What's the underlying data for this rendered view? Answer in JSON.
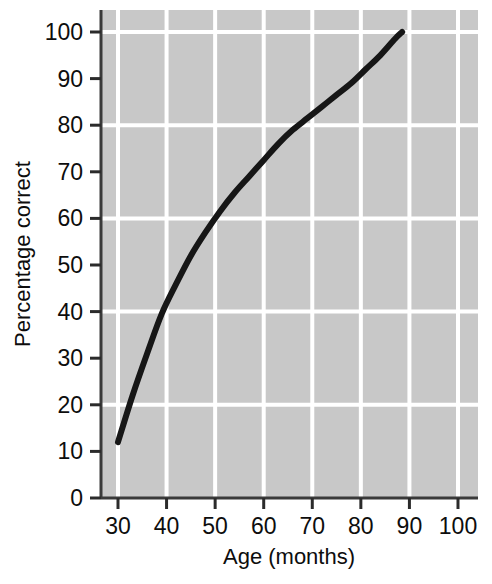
{
  "chart_data": {
    "type": "line",
    "title": "",
    "xlabel": "Age (months)",
    "ylabel": "Percentage correct",
    "xlim": [
      25,
      103
    ],
    "ylim": [
      0,
      105
    ],
    "xticks": [
      30,
      40,
      50,
      60,
      70,
      80,
      90,
      100
    ],
    "yticks": [
      0,
      10,
      20,
      30,
      40,
      50,
      60,
      70,
      80,
      90,
      100
    ],
    "xtick_labels": [
      "30",
      "40",
      "50",
      "60",
      "70",
      "80",
      "90",
      "100"
    ],
    "ytick_labels": [
      "0",
      "10",
      "20",
      "30",
      "40",
      "50",
      "60",
      "70",
      "80",
      "90",
      "100"
    ],
    "grid": true,
    "grid_x_values": [
      30,
      40,
      50,
      60,
      70,
      80,
      90,
      100
    ],
    "grid_y_values": [
      20,
      40,
      60,
      80,
      100
    ],
    "grid_color": "#ffffff",
    "plot_background": "#c8c8c8",
    "line_color": "#161616",
    "line_width": 6,
    "legend": null,
    "series": [
      {
        "name": "Percentage correct by age",
        "x": [
          30,
          33,
          36,
          39,
          42,
          45,
          48,
          51,
          54,
          57,
          60,
          63,
          66,
          69,
          72,
          75,
          78,
          81,
          84,
          87,
          88.5
        ],
        "y": [
          12,
          22,
          31,
          39.5,
          46,
          52,
          57,
          61.5,
          65.5,
          69,
          72.5,
          76,
          79,
          81.5,
          84,
          86.5,
          89,
          92,
          95,
          98.5,
          100
        ]
      }
    ]
  },
  "axis": {
    "x_title": "Age (months)",
    "y_title": "Percentage correct"
  }
}
